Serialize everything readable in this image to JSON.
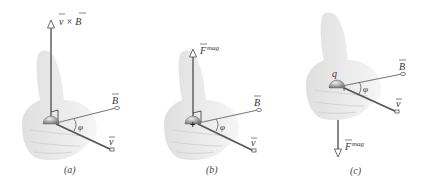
{
  "figure": {
    "panels": [
      {
        "id": "a",
        "caption": "(a)",
        "vertical_vector_label": "v × B",
        "vertical_vector_direction": "up",
        "b_label": "B",
        "v_label": "v",
        "angle_label": "φ",
        "charge_label": ""
      },
      {
        "id": "b",
        "caption": "(b)",
        "vertical_vector_label": "F",
        "vertical_vector_superscript": "mag",
        "vertical_vector_direction": "up",
        "b_label": "B",
        "v_label": "v",
        "angle_label": "φ",
        "charge_sign": "+"
      },
      {
        "id": "c",
        "caption": "(c)",
        "vertical_vector_label": "F",
        "vertical_vector_superscript": "mag",
        "vertical_vector_direction": "down",
        "b_label": "B",
        "v_label": "v",
        "angle_label": "φ",
        "charge_label": "q"
      }
    ],
    "colors": {
      "vector_line": "#6a6a6a",
      "hand_fill": "#e6e6e6",
      "hand_shade": "#d6d6d6",
      "label_text": "#333333"
    }
  }
}
